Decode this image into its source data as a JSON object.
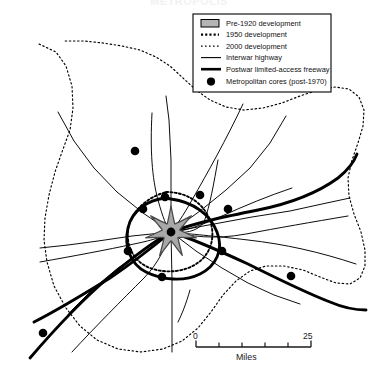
{
  "figure": {
    "title": "METROPOLIS",
    "kind": "schematic-map"
  },
  "legend": {
    "items": [
      {
        "symbol": "gray-swatch",
        "label": "Pre-1920 development"
      },
      {
        "symbol": "bold-dotted-line",
        "label": "1950 development"
      },
      {
        "symbol": "light-dotted-line",
        "label": "2000 development"
      },
      {
        "symbol": "thin-solid-line",
        "label": "Interwar highway"
      },
      {
        "symbol": "thick-solid-line",
        "label": "Postwar limited-access freeway"
      },
      {
        "symbol": "black-dot",
        "label": "Metropolitan cores (post-1970)"
      }
    ]
  },
  "scale_bar": {
    "min_label": "0",
    "max_label": "25",
    "unit_label": "Miles",
    "ticks": 5
  },
  "colors": {
    "ink": "#000000",
    "core_fill": "#a8a8a8",
    "core_stroke": "#4a4a4a",
    "paper": "#ffffff"
  },
  "chart_data": {
    "type": "map",
    "title": "METROPOLIS",
    "boundaries": [
      {
        "name": "1950 development",
        "style": "bold-dotted",
        "points": "166,192 183,193 196,199 206,210 211,223 210,238 203,252 190,261 174,265 158,264 145,257 136,246 132,232 134,218 142,205 153,196"
      },
      {
        "name": "2000 development",
        "style": "light-dotted",
        "points": "39,44 56,52 66,66 72,86 73,108 70,130 62,152 55,172 49,195 45,218 44,240 47,262 54,286 66,308 80,326 97,340 118,349 141,352 163,349 182,341 198,328 211,312 223,295 236,281 250,271 266,266 284,266 303,270 320,277 336,283 350,284 360,278 365,266 365,250 361,232 354,214 349,196 348,178 352,160 358,143 363,126 364,110 359,97 349,89 335,87 318,90 300,96 282,103 263,108 244,110 226,107 210,100 196,90 183,78 170,66 156,57 140,50 122,46 103,43 84,41 64,41"
      }
    ],
    "core_star": {
      "name": "Pre-1920 development",
      "center": [
        171,
        232
      ],
      "lobes": 7,
      "outer_radius": 26,
      "inner_radius": 9
    },
    "freeways": [
      {
        "name": "freeway-nw-se",
        "points": "30,355 52,327 74,300 96,276 120,256 143,242 171,232 199,226 226,222 252,219 276,215 300,209 322,199 340,185 352,168"
      },
      {
        "name": "freeway-sw-ne",
        "points": "34,318 57,306 80,292 102,277 124,261 147,247 171,232 196,238 220,248 244,259 268,272 292,286 316,298 338,306 356,309"
      },
      {
        "name": "freeway-ring",
        "points": "171,199 192,203 208,214 217,232 215,251 204,265 187,273 168,274 150,270 137,259 130,243 132,226 141,211 155,202"
      }
    ],
    "highways": [
      {
        "name": "hwy-n",
        "points": "171,232 171,160 169,120 166,96"
      },
      {
        "name": "hwy-s",
        "points": "171,232 172,280 172,320 172,352"
      },
      {
        "name": "hwy-e",
        "points": "171,232 214,224 252,217 290,211 322,204 350,198"
      },
      {
        "name": "hwy-w",
        "points": "171,232 132,236 98,241 68,245 40,248"
      },
      {
        "name": "hwy-ne",
        "points": "171,232 200,211 226,190 250,168 270,143 286,116"
      },
      {
        "name": "hwy-nw",
        "points": "171,232 143,213 117,192 94,168 74,141 58,112"
      },
      {
        "name": "hwy-se",
        "points": "171,232 196,251 222,268 248,283 274,295 300,304"
      },
      {
        "name": "hwy-sw",
        "points": "171,232 144,250 118,268 94,288 72,310 54,332"
      }
    ],
    "cores": [
      {
        "id": "core-center",
        "x": 171,
        "y": 232
      },
      {
        "id": "core-north",
        "x": 135,
        "y": 151
      },
      {
        "id": "core-n-inner",
        "x": 165,
        "y": 197
      },
      {
        "id": "core-ne-inner",
        "x": 200,
        "y": 195
      },
      {
        "id": "core-e-outer",
        "x": 228,
        "y": 209
      },
      {
        "id": "core-nw-ring",
        "x": 143,
        "y": 209
      },
      {
        "id": "core-w-ring",
        "x": 128,
        "y": 251
      },
      {
        "id": "core-e-ring",
        "x": 222,
        "y": 251
      },
      {
        "id": "core-s-ring",
        "x": 162,
        "y": 277
      },
      {
        "id": "core-se-far",
        "x": 291,
        "y": 276
      },
      {
        "id": "core-sw-far",
        "x": 43,
        "y": 333
      }
    ]
  }
}
